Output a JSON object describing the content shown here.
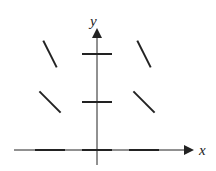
{
  "diagram": {
    "type": "slope-field",
    "x_axis_label": "x",
    "y_axis_label": "y",
    "stroke_color": "#222222",
    "segments": [
      {
        "x": -1,
        "y": 0,
        "slope": 0
      },
      {
        "x": 0,
        "y": 0,
        "slope": 0
      },
      {
        "x": 1,
        "y": 0,
        "slope": 0
      },
      {
        "x": -1,
        "y": 1,
        "slope": -1
      },
      {
        "x": 0,
        "y": 1,
        "slope": 0
      },
      {
        "x": 1,
        "y": 1,
        "slope": -1
      },
      {
        "x": -1,
        "y": 2,
        "slope": -2
      },
      {
        "x": 0,
        "y": 2,
        "slope": 0
      },
      {
        "x": 1,
        "y": 2,
        "slope": -2
      }
    ]
  }
}
